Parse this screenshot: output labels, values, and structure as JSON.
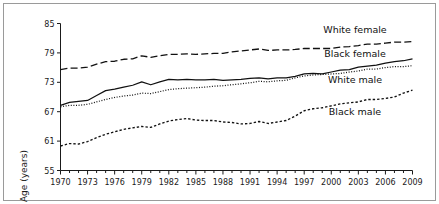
{
  "figure": {
    "background_color": "#ffffff",
    "frame_color": "#9a9a9a",
    "axis_color": "#1a1a1a"
  },
  "chart_data": {
    "type": "line",
    "title": "",
    "subtitle": "",
    "xlabel": "",
    "ylabel": "Age (years)",
    "xlim": [
      1970,
      2009
    ],
    "ylim": [
      55,
      85
    ],
    "grid": false,
    "legend_position": "inline-right",
    "x_tick_labels": [
      "1970",
      "1973",
      "1976",
      "1979",
      "1982",
      "1985",
      "1988",
      "1991",
      "1994",
      "1997",
      "2000",
      "2003",
      "2006",
      "2009"
    ],
    "x_tick_values": [
      1970,
      1973,
      1976,
      1979,
      1982,
      1985,
      1988,
      1991,
      1994,
      1997,
      2000,
      2003,
      2006,
      2009
    ],
    "x_minor_tick_step": 1,
    "y_tick_labels": [
      "55",
      "61",
      "67",
      "73",
      "79",
      "85"
    ],
    "y_tick_values": [
      55,
      61,
      67,
      73,
      79,
      85
    ],
    "x": [
      1970,
      1971,
      1972,
      1973,
      1974,
      1975,
      1976,
      1977,
      1978,
      1979,
      1980,
      1981,
      1982,
      1983,
      1984,
      1985,
      1986,
      1987,
      1988,
      1989,
      1990,
      1991,
      1992,
      1993,
      1994,
      1995,
      1996,
      1997,
      1998,
      1999,
      2000,
      2001,
      2002,
      2003,
      2004,
      2005,
      2006,
      2007,
      2008,
      2009
    ],
    "series": [
      {
        "name": "White female",
        "line_style": "long-dash",
        "color": "#111111",
        "label_text": "White female",
        "values": [
          75.6,
          75.9,
          75.9,
          76.1,
          76.7,
          77.2,
          77.3,
          77.7,
          77.8,
          78.4,
          78.1,
          78.4,
          78.7,
          78.7,
          78.8,
          78.7,
          78.8,
          78.9,
          78.9,
          79.2,
          79.4,
          79.6,
          79.8,
          79.5,
          79.6,
          79.6,
          79.7,
          79.9,
          79.9,
          79.9,
          79.9,
          80.2,
          80.3,
          80.5,
          80.8,
          80.8,
          81.0,
          81.2,
          81.2,
          81.3
        ]
      },
      {
        "name": "Black female",
        "line_style": "solid",
        "color": "#111111",
        "label_text": "Black female",
        "values": [
          68.3,
          68.9,
          69.1,
          69.3,
          70.3,
          71.3,
          71.6,
          72.0,
          72.4,
          73.1,
          72.5,
          73.1,
          73.6,
          73.5,
          73.6,
          73.5,
          73.5,
          73.6,
          73.4,
          73.5,
          73.6,
          73.8,
          73.9,
          73.7,
          73.9,
          73.9,
          74.2,
          74.7,
          74.8,
          74.7,
          75.1,
          75.5,
          75.6,
          76.1,
          76.3,
          76.5,
          76.9,
          77.2,
          77.4,
          77.8
        ]
      },
      {
        "name": "White male",
        "line_style": "dotted",
        "color": "#111111",
        "label_text": "White male",
        "values": [
          68.0,
          68.3,
          68.3,
          68.5,
          69.0,
          69.5,
          69.9,
          70.2,
          70.4,
          70.8,
          70.7,
          71.1,
          71.5,
          71.7,
          71.8,
          71.9,
          72.0,
          72.2,
          72.3,
          72.5,
          72.7,
          72.9,
          73.2,
          73.1,
          73.3,
          73.4,
          73.9,
          74.3,
          74.5,
          74.6,
          74.7,
          74.8,
          75.1,
          75.3,
          75.7,
          75.7,
          76.0,
          76.2,
          76.2,
          76.4
        ]
      },
      {
        "name": "Black male",
        "line_style": "short-dash",
        "color": "#111111",
        "label_text": "Black male",
        "values": [
          60.0,
          60.5,
          60.4,
          60.9,
          61.7,
          62.4,
          62.9,
          63.4,
          63.7,
          64.0,
          63.8,
          64.5,
          65.1,
          65.4,
          65.6,
          65.3,
          65.2,
          65.2,
          64.9,
          64.8,
          64.5,
          64.6,
          65.0,
          64.6,
          64.9,
          65.2,
          66.1,
          67.2,
          67.6,
          67.8,
          68.2,
          68.6,
          68.8,
          69.0,
          69.5,
          69.5,
          69.7,
          70.0,
          70.8,
          71.4
        ]
      }
    ],
    "annotations": []
  }
}
